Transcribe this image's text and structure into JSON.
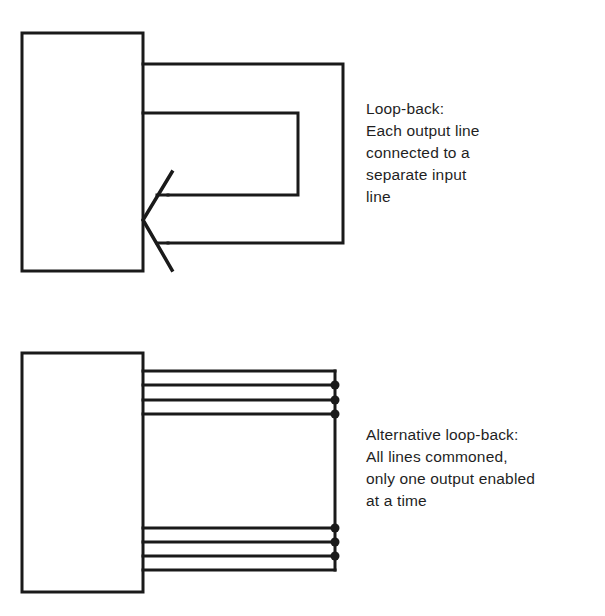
{
  "figure": {
    "type": "technical-line-diagram",
    "background_color": "#ffffff",
    "line_color": "#1a1a1a",
    "panels": [
      {
        "id": "top",
        "name": "loop-back",
        "device_box": {
          "x": 22,
          "y": 33,
          "width": 121,
          "height": 238
        },
        "caption_lines": [
          "Loop-back:",
          "Each output line",
          "connected to a",
          "separate input",
          "line"
        ],
        "loops": [
          {
            "name": "outer-loop",
            "top_y": 64,
            "right_x": 343,
            "bottom_y": 243
          },
          {
            "name": "inner-loop",
            "top_y": 113,
            "right_x": 298,
            "bottom_y": 195
          }
        ],
        "arrowhead": {
          "tip_x": 143,
          "tip_y": 220,
          "barb_x": 172,
          "upper_y": 172,
          "lower_y": 270
        }
      },
      {
        "id": "bottom",
        "name": "alternative-loop-back",
        "device_box": {
          "x": 22,
          "y": 353,
          "width": 121,
          "height": 239
        },
        "caption_lines": [
          "Alternative loop-back:",
          "All lines commoned,",
          "only one output enabled",
          "at a time"
        ],
        "bus_x": 335,
        "upper_lines_y": [
          371,
          385,
          400,
          414
        ],
        "lower_lines_y": [
          528,
          542,
          556,
          570
        ],
        "junction_dots_y": [
          385,
          400,
          414,
          528,
          542,
          556
        ],
        "junction_dot_radius": 4.5
      }
    ]
  },
  "caption_top": "Loop-back:\nEach output line\nconnected to a\nseparate input\nline",
  "caption_bottom": "Alternative loop-back:\nAll lines commoned,\nonly one output enabled\nat a time"
}
